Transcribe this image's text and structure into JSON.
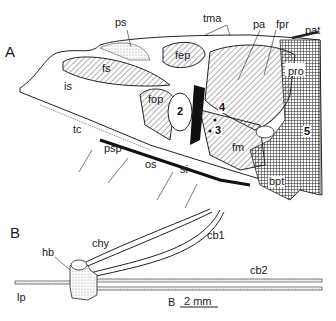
{
  "panels": {
    "A": {
      "letter": "A",
      "labels": {
        "ps": "ps",
        "tma": "tma",
        "pa": "pa",
        "fpr": "fpr",
        "pat": "pat",
        "fs": "fs",
        "fep": "fep",
        "pro": "pro",
        "is": "is",
        "fop": "fop",
        "n2": "2",
        "n4": "4",
        "n3": "3",
        "n5": "5",
        "tc": "tc",
        "psp": "psp",
        "os": "os",
        "si": "si",
        "fm": "fm",
        "bpt": "bpt"
      }
    },
    "B": {
      "letter": "B",
      "labels": {
        "chy": "chy",
        "cb1": "cb1",
        "hb": "hb",
        "cb2": "cb2",
        "lp": "lp"
      },
      "scale_bar": {
        "letter": "B",
        "value": "2 mm"
      }
    }
  },
  "colors": {
    "ink": "#1a1a1a",
    "background": "#ffffff",
    "stipple": "#c8c8c8"
  }
}
